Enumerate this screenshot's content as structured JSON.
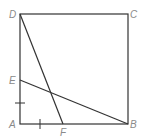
{
  "diagram": {
    "type": "geometry",
    "shape": "square ABCD with segments DF and BE",
    "points": {
      "A": {
        "label": "A",
        "x": 20,
        "y": 124
      },
      "B": {
        "label": "B",
        "x": 128,
        "y": 124
      },
      "C": {
        "label": "C",
        "x": 128,
        "y": 14
      },
      "D": {
        "label": "D",
        "x": 20,
        "y": 14
      },
      "E": {
        "label": "E",
        "x": 20,
        "y": 80
      },
      "F": {
        "label": "F",
        "x": 63,
        "y": 124
      }
    },
    "segments": [
      "AB",
      "BC",
      "CD",
      "DA",
      "DF",
      "BE"
    ],
    "equal_marks": [
      "AE",
      "AF"
    ],
    "colors": {
      "line": "#333333",
      "label": "#8a8a8a"
    }
  }
}
